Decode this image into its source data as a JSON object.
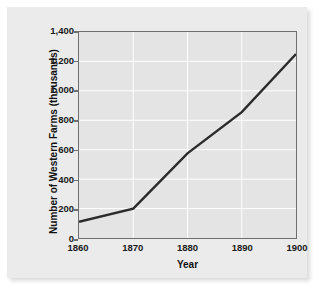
{
  "chart_data": {
    "type": "line",
    "title": "",
    "xlabel": "Year",
    "ylabel": "Number of Western Farms (thousands)",
    "x": [
      1860,
      1870,
      1880,
      1890,
      1900
    ],
    "values": [
      110,
      200,
      575,
      855,
      1250
    ],
    "xticklabels": [
      "1860",
      "1870",
      "1880",
      "1890",
      "1900"
    ],
    "yticklabels": [
      "0",
      "200",
      "400",
      "600",
      "800",
      "1,000",
      "1,200",
      "1,400"
    ],
    "ytickvalues": [
      0,
      200,
      400,
      600,
      800,
      1000,
      1200,
      1400
    ],
    "xlim": [
      1860,
      1900
    ],
    "ylim": [
      0,
      1400
    ],
    "grid": true,
    "legend": null,
    "series": [
      {
        "name": "Number of Western Farms (thousands)",
        "values": [
          110,
          200,
          575,
          855,
          1250
        ]
      }
    ],
    "colors": {
      "line": "#2b2b2b",
      "plot_background": "#e4e4e4",
      "panel_background": "#ebebeb",
      "gridline": "#ffffff",
      "axis_frame": "#6f6f6f",
      "text": "#111111"
    }
  }
}
